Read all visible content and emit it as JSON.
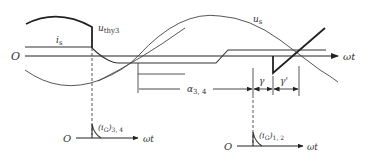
{
  "diagram": {
    "labels": {
      "u_thy3": "u",
      "u_thy3_sub": "thy3",
      "u_s": "u",
      "u_s_sub": "s",
      "i_s": "i",
      "i_s_sub": "s",
      "origin_main": "O",
      "origin_bottom_left": "O",
      "origin_bottom_right": "O",
      "axis_main": "ωt",
      "axis_bottom_left": "ωt",
      "axis_bottom_right": "ωt",
      "alpha": "α",
      "alpha_sub": "3, 4",
      "gamma": "γ",
      "gamma_prime": "γ'",
      "iG_34": "(i",
      "iG_34_G": "G",
      "iG_34_close": ")",
      "iG_34_sub": "3, 4",
      "iG_12": "(i",
      "iG_12_G": "G",
      "iG_12_close": ")",
      "iG_12_sub": "1, 2"
    },
    "colors": {
      "line": "#333333",
      "background": "#ffffff"
    }
  }
}
